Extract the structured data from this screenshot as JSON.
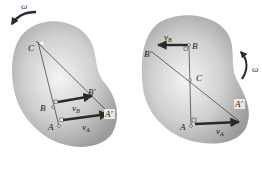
{
  "figure": {
    "colors": {
      "body_fill_center": "#f2f2f2",
      "body_fill_edge": "#9a9a9a",
      "line": "#333333",
      "arrow": "#2a2a2a",
      "label_box": "#e8e8e8"
    },
    "left": {
      "omega_label": "ω",
      "points": {
        "C": "C",
        "B": "B",
        "A": "A",
        "B_prime": "B′",
        "A_prime": "A′"
      },
      "velocities": {
        "vB": "v",
        "vB_sub": "B",
        "vA": "v",
        "vA_sub": "A"
      },
      "rotation": "counterclockwise"
    },
    "right": {
      "omega_label": "ω",
      "points": {
        "C": "C",
        "B": "B",
        "A": "A",
        "B_prime": "B′",
        "A_prime": "A′"
      },
      "velocities": {
        "vB": "v",
        "vB_sub": "B",
        "vA": "v",
        "vA_sub": "A"
      },
      "rotation": "counterclockwise"
    }
  }
}
